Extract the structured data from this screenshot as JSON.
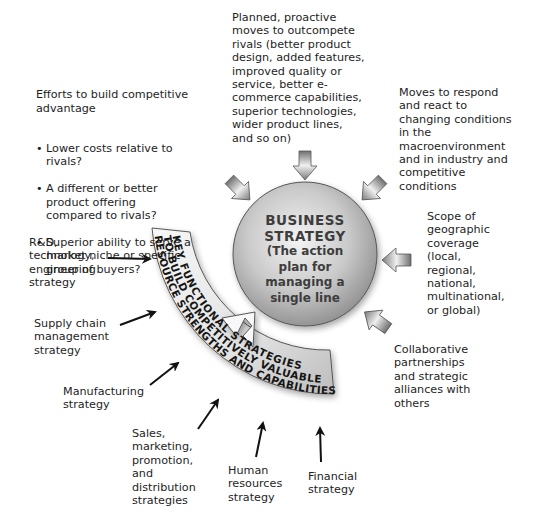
{
  "center": {
    "title_line1": "BUSINESS",
    "title_line2": "STRATEGY",
    "subtitle_line1": "(The action",
    "subtitle_line2": "plan for",
    "subtitle_line3": "managing a",
    "subtitle_line4": "single line"
  },
  "band": {
    "line1": "KEY FUNCTIONAL STRATEGIES",
    "line2": "TO BUILD COMPETITIVELY VALUABLE",
    "line3": "RESOURCE STRENGTHS AND CAPABILITIES"
  },
  "inputs_to_strategy": {
    "competitive_advantage": {
      "heading": "Efforts to build competitive\nadvantage",
      "bullets": [
        "Lower costs relative to\nrivals?",
        "A different or better\nproduct offering\ncompared to rivals?",
        "Superior ability to serve a\nmarket niche or specific\ngroup of buyers?"
      ]
    },
    "proactive_moves": "Planned, proactive\nmoves to outcompete\nrivals (better product\ndesign, added features,\nimproved quality or\nservice, better e-\ncommerce capabilities,\nsuperior technologies,\nwider product lines,\nand so on)",
    "reactive_moves": "Moves to respond\nand react to\nchanging conditions\nin the\nmacroenvironment\nand in industry and\ncompetitive\nconditions",
    "geographic_scope": "Scope of\ngeographic\ncoverage\n(local,\nregional,\nnational,\nmultinational,\nor global)",
    "partnerships": "Collaborative\npartnerships\nand strategic\nalliances with\nothers"
  },
  "functional_strategies": {
    "rnd": "R&D,\ntechnology,\nengineering\nstrategy",
    "supply_chain": "Supply chain\nmanagement\nstrategy",
    "manufacturing": "Manufacturing\nstrategy",
    "sales": "Sales,\nmarketing,\npromotion,\nand\ndistribution\nstrategies",
    "human_resources": "Human\nresources\nstrategy",
    "financial": "Financial\nstrategy"
  },
  "colors": {
    "circle_light": "#f2f2f2",
    "circle_dark": "#8c8c8c",
    "band_light": "#f5f5f5",
    "band_dark": "#b4b4b4",
    "arrow_dark": "#7a7a7a",
    "text": "#1e1e1e"
  }
}
